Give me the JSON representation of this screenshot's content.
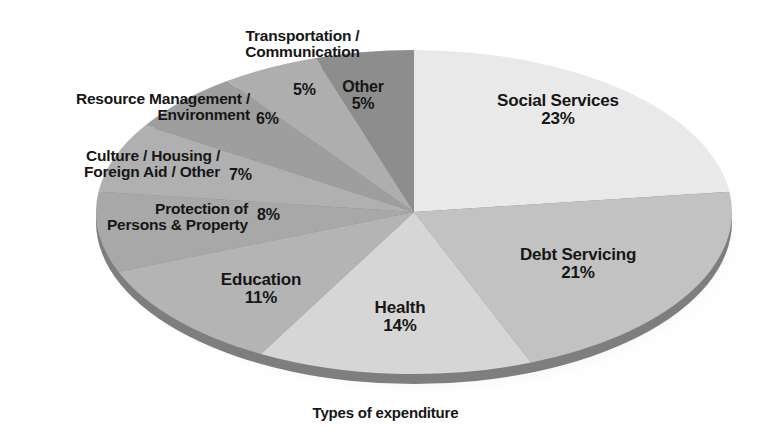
{
  "caption": "Types of expenditure",
  "chart_data": {
    "type": "pie",
    "title": "",
    "subtitle": "",
    "xlabel": "Types of expenditure",
    "ylabel": "",
    "legend_position": "none",
    "grid": false,
    "value_unit": "%",
    "start_angle_deg": 0,
    "direction": "clockwise",
    "style": "3d-ellipse-with-drop-shadow",
    "categories": [
      "Social Services",
      "Debt Servicing",
      "Health",
      "Education",
      "Protection of Persons & Property",
      "Culture / Housing / Foreign Aid / Other",
      "Resource Management / Environment",
      "Transportation / Communication",
      "Other"
    ],
    "values": [
      23,
      21,
      14,
      11,
      8,
      7,
      6,
      5,
      5
    ],
    "labels": [
      "23%",
      "21%",
      "14%",
      "11%",
      "8%",
      "7%",
      "6%",
      "5%",
      "5%"
    ],
    "colors": [
      "#e9e9e9",
      "#c2c2c2",
      "#d6d6d6",
      "#b4b4b4",
      "#a8a8a8",
      "#b0b0b0",
      "#9e9e9e",
      "#aeaeae",
      "#8d8d8d"
    ]
  },
  "slices": [
    {
      "id": "social-services",
      "name": "Social Services",
      "percent": "23%",
      "color": "#e9e9e9",
      "label_placement": "inside"
    },
    {
      "id": "debt-servicing",
      "name": "Debt Servicing",
      "percent": "21%",
      "color": "#c2c2c2",
      "label_placement": "inside"
    },
    {
      "id": "health",
      "name": "Health",
      "percent": "14%",
      "color": "#d6d6d6",
      "label_placement": "inside"
    },
    {
      "id": "education",
      "name": "Education",
      "percent": "11%",
      "color": "#b4b4b4",
      "label_placement": "inside"
    },
    {
      "id": "protection",
      "name_line1": "Protection of",
      "name_line2": "Persons & Property",
      "percent": "8%",
      "color": "#a8a8a8",
      "label_placement": "outside-left"
    },
    {
      "id": "culture-housing",
      "name_line1": "Culture / Housing /",
      "name_line2": "Foreign Aid / Other",
      "percent": "7%",
      "color": "#b0b0b0",
      "label_placement": "outside-left"
    },
    {
      "id": "resource-management",
      "name_line1": "Resource Management /",
      "name_line2": "Environment",
      "percent": "6%",
      "color": "#9e9e9e",
      "label_placement": "outside-left"
    },
    {
      "id": "transportation",
      "name_line1": "Transportation /",
      "name_line2": "Communication",
      "percent": "5%",
      "color": "#aeaeae",
      "label_placement": "outside-top"
    },
    {
      "id": "other",
      "name": "Other",
      "percent": "5%",
      "color": "#8d8d8d",
      "label_placement": "outside-top"
    }
  ]
}
